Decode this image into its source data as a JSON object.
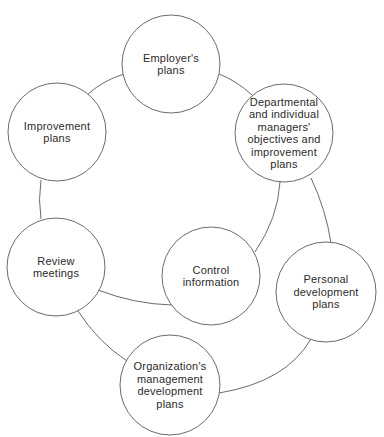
{
  "diagram": {
    "type": "cycle",
    "stroke_color": "#6a6a6a",
    "fill_color": "#ffffff",
    "text_color": "#2b2b2b",
    "nodes": [
      {
        "id": "employers-plans",
        "lines": [
          "Employer's",
          "plans"
        ],
        "cx": 171,
        "cy": 64,
        "r": 49
      },
      {
        "id": "improvement-plans",
        "lines": [
          "Improvement",
          "plans"
        ],
        "cx": 57,
        "cy": 132,
        "r": 49
      },
      {
        "id": "departmental-objectives",
        "lines": [
          "Departmental",
          "and  individual",
          "managers'",
          "objectives and",
          "improvement",
          "plans"
        ],
        "cx": 284,
        "cy": 133,
        "r": 49
      },
      {
        "id": "review-meetings",
        "lines": [
          "Review",
          "meetings"
        ],
        "cx": 56,
        "cy": 267,
        "r": 49
      },
      {
        "id": "control-information",
        "lines": [
          "Control",
          "information"
        ],
        "cx": 211,
        "cy": 276,
        "r": 49
      },
      {
        "id": "personal-development-plans",
        "lines": [
          "Personal",
          "development",
          "plans"
        ],
        "cx": 326,
        "cy": 292,
        "r": 50
      },
      {
        "id": "organizations-management-development-plans",
        "lines": [
          "Organization's",
          "management",
          "development",
          "plans"
        ],
        "cx": 170,
        "cy": 385,
        "r": 50
      }
    ],
    "connectors": [
      {
        "from": "improvement-plans",
        "to": "employers-plans",
        "d": "M88,94 Q104,80 124,74"
      },
      {
        "from": "employers-plans",
        "to": "departmental-objectives",
        "d": "M219,74 Q237,81 252,95"
      },
      {
        "from": "improvement-plans",
        "to": "review-meetings",
        "d": "M41,180 Q38,200 41,219"
      },
      {
        "from": "review-meetings",
        "to": "control-information",
        "d": "M98,290 Q134,304 172,305"
      },
      {
        "from": "control-information",
        "to": "departmental-objectives",
        "d": "M255,252 Q278,218 280,182"
      },
      {
        "from": "departmental-objectives",
        "to": "personal-development-plans",
        "d": "M311,178 Q326,210 331,243"
      },
      {
        "from": "review-meetings",
        "to": "organizations-management-development-plans",
        "d": "M78,311 Q98,342 127,361"
      },
      {
        "from": "organizations-management-development-plans",
        "to": "personal-development-plans",
        "d": "M219,393 Q286,382 311,339"
      }
    ]
  }
}
